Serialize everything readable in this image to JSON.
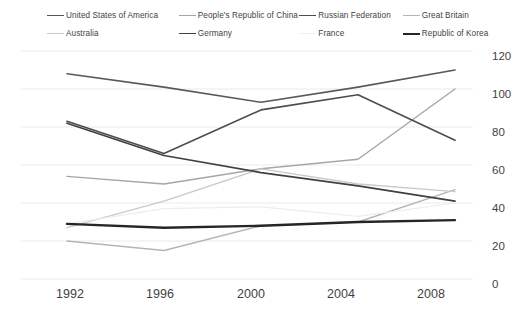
{
  "chart": {
    "type": "line",
    "title": "",
    "xlabel": "",
    "ylabel": ""
  },
  "legend": {
    "position": "top",
    "rows": [
      [
        {
          "label": "United States of America",
          "color": "#595959",
          "width": 1.6
        },
        {
          "label": "People's Republic of China",
          "color": "#a6a6a6",
          "width": 1.4
        },
        {
          "label": "Russian Federation",
          "color": "#4d4d4d",
          "width": 1.6
        },
        {
          "label": "Great Britain",
          "color": "#b5b5b5",
          "width": 1.4
        }
      ],
      [
        {
          "label": "Australia",
          "color": "#c9c9c9",
          "width": 1.3
        },
        {
          "label": "Germany",
          "color": "#404040",
          "width": 1.7
        },
        {
          "label": "France",
          "color": "#ededed",
          "width": 1.2
        },
        {
          "label": "Republic of Korea",
          "color": "#262626",
          "width": 2.4
        }
      ]
    ]
  },
  "axes": {
    "y_ticks": [
      "120",
      "100",
      "80",
      "60",
      "40",
      "20",
      "0"
    ],
    "x_ticks": [
      "1992",
      "1996",
      "2000",
      "2004",
      "2008"
    ],
    "ylim": [
      0,
      120
    ],
    "grid": true,
    "grid_color": "#ebebeb",
    "y_axis_side": "right"
  },
  "chart_data": {
    "type": "line",
    "title": "",
    "xlabel": "",
    "ylabel": "",
    "ylim": [
      0,
      120
    ],
    "grid": true,
    "legend_position": "top",
    "categories": [
      "1992",
      "1996",
      "2000",
      "2004",
      "2008"
    ],
    "series": [
      {
        "name": "United States of America",
        "color": "#595959",
        "width": 1.6,
        "values": [
          108,
          101,
          93,
          101,
          110
        ]
      },
      {
        "name": "People's Republic of China",
        "color": "#a6a6a6",
        "width": 1.4,
        "values": [
          54,
          50,
          58,
          63,
          100
        ]
      },
      {
        "name": "Russian Federation",
        "color": "#4d4d4d",
        "width": 1.6,
        "values": [
          83,
          66,
          89,
          97,
          73
        ]
      },
      {
        "name": "Great Britain",
        "color": "#b5b5b5",
        "width": 1.4,
        "values": [
          20,
          15,
          28,
          30,
          47
        ]
      },
      {
        "name": "Australia",
        "color": "#c9c9c9",
        "width": 1.3,
        "values": [
          27,
          41,
          58,
          50,
          46
        ]
      },
      {
        "name": "Germany",
        "color": "#404040",
        "width": 1.7,
        "values": [
          82,
          65,
          56,
          49,
          41
        ]
      },
      {
        "name": "France",
        "color": "#ededed",
        "width": 1.2,
        "values": [
          29,
          37,
          38,
          33,
          40
        ]
      },
      {
        "name": "Republic of Korea",
        "color": "#262626",
        "width": 2.4,
        "values": [
          29,
          27,
          28,
          30,
          31
        ]
      }
    ]
  }
}
